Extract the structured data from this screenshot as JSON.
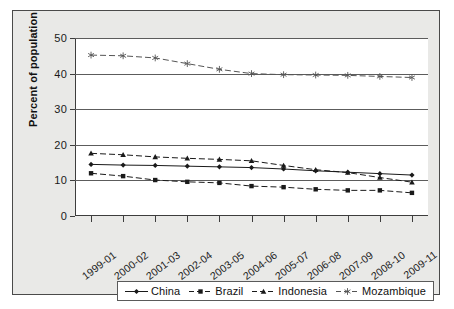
{
  "chart_data": {
    "type": "line",
    "title": "",
    "xlabel": "",
    "ylabel": "Percent of population",
    "ylim": [
      0,
      50
    ],
    "yticks": [
      0,
      10,
      20,
      30,
      40,
      50
    ],
    "grid": true,
    "legend_position": "bottom",
    "categories": [
      "1999-01",
      "2000-02",
      "2001-03",
      "2002-04",
      "2003-05",
      "2004-06",
      "2005-07",
      "2006-08",
      "2007-09",
      "2008-10",
      "2009-11"
    ],
    "series": [
      {
        "name": "China",
        "marker": "diamond",
        "line_style": "solid",
        "color": "#1a1a1a",
        "values": [
          14.5,
          14.3,
          14.2,
          14.0,
          13.8,
          13.6,
          13.2,
          12.7,
          12.3,
          11.9,
          11.5
        ]
      },
      {
        "name": "Brazil",
        "marker": "square",
        "line_style": "dashed",
        "color": "#1a1a1a",
        "values": [
          12.0,
          11.2,
          10.1,
          9.6,
          9.3,
          8.4,
          8.1,
          7.5,
          7.2,
          7.2,
          6.5
        ]
      },
      {
        "name": "Indonesia",
        "marker": "triangle",
        "line_style": "dashed",
        "color": "#1a1a1a",
        "values": [
          17.6,
          17.2,
          16.6,
          16.2,
          15.9,
          15.5,
          14.2,
          13.0,
          12.2,
          10.8,
          9.5
        ]
      },
      {
        "name": "Mozambique",
        "marker": "asterisk",
        "line_style": "dashed",
        "color": "#555555",
        "values": [
          45.2,
          45.0,
          44.4,
          42.8,
          41.2,
          40.0,
          39.7,
          39.6,
          39.5,
          39.2,
          38.9
        ]
      }
    ]
  },
  "legend": {
    "entries": [
      {
        "label": "China"
      },
      {
        "label": "Brazil"
      },
      {
        "label": "Indonesia"
      },
      {
        "label": "Mozambique"
      }
    ]
  }
}
